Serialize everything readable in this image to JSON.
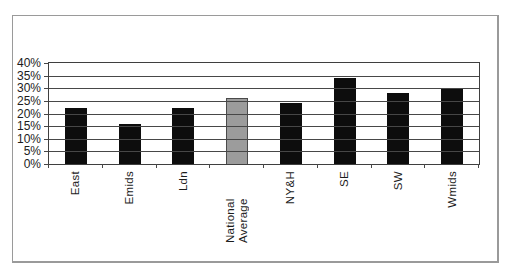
{
  "chart_data": {
    "type": "bar",
    "categories": [
      "East",
      "Emids",
      "Ldn",
      "National Average",
      "NY&H",
      "SE",
      "SW",
      "Wmids"
    ],
    "values": [
      22,
      16,
      22,
      26,
      24,
      34,
      28,
      30
    ],
    "title": "",
    "xlabel": "",
    "ylabel": "",
    "ylim": [
      0,
      40
    ],
    "ytick_step": 5,
    "ytick_labels": [
      "0%",
      "5%",
      "10%",
      "15%",
      "20%",
      "25%",
      "30%",
      "35%",
      "40%"
    ],
    "grid": true,
    "legend_position": "none",
    "bar_color": "#0d0d0d",
    "highlight_category": "National Average",
    "highlight_color": "#9c9c9c",
    "highlight_border_color": "#4a4a4a",
    "axis_color": "#474747",
    "frame_border_color": "#9a9a9a"
  }
}
